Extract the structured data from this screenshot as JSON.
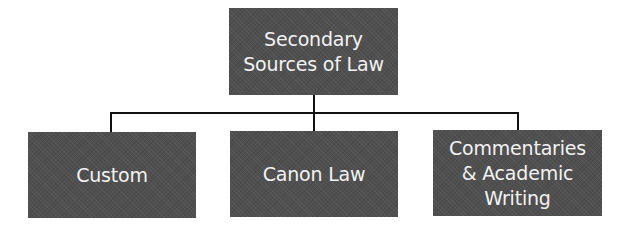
{
  "diagram": {
    "type": "hierarchy",
    "root": {
      "label_line1": "Secondary",
      "label_line2": "Sources of Law"
    },
    "children": [
      {
        "label": "Custom"
      },
      {
        "label": "Canon Law"
      },
      {
        "label_line1": "Commentaries",
        "label_line2": "& Academic",
        "label_line3": "Writing"
      }
    ],
    "colors": {
      "box_fill": "#4f4f4f",
      "box_text": "#f2f2f2",
      "connector": "#111111",
      "background": "#ffffff"
    }
  }
}
